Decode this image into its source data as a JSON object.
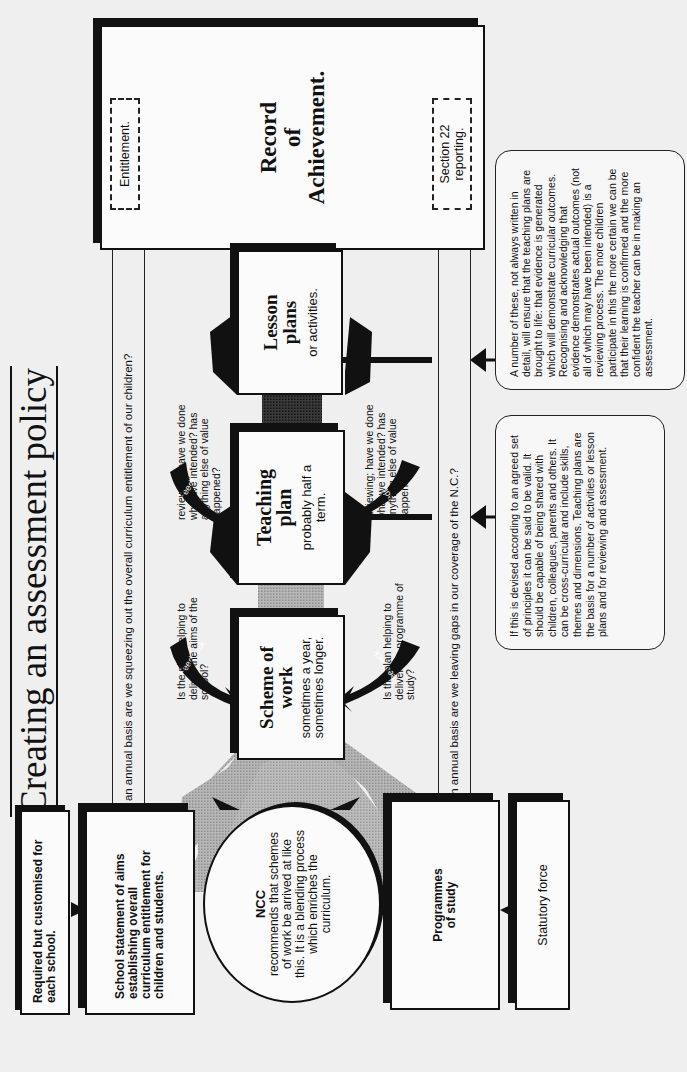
{
  "title": "Creating an assessment policy",
  "feedback_lines": {
    "top": "Feedback: on an annual basis are we squeezing out the overall curriculum entitlement of our children?",
    "bottom": "Feedback: on an annual basis are we leaving gaps in our coverage of the N.C.?"
  },
  "record_of_achievement": {
    "title_lines": [
      "Record",
      "of",
      "Achievement."
    ],
    "entitlement_label": "Entitlement.",
    "section22_label": "Section 22 reporting."
  },
  "lesson_plans": {
    "title": "Lesson plans",
    "subtitle": "or activities.",
    "question_top": "reviewing; have we done what we intended? has anything else of value happened?",
    "question_bottom": "reviewing; have we done what we intended? has anything else of value happened?"
  },
  "teaching_plan": {
    "title": "Teaching plan",
    "subtitle": "probably half a term.",
    "question_top": "Is the plan helping to deliver the aims of the school?",
    "question_bottom": "Is the plan helping to deliver the programme of study?"
  },
  "scheme_of_work": {
    "title": "Scheme of work",
    "subtitle": "sometimes a year, sometimes longer."
  },
  "feedback_arrow_label": "Feedback",
  "notes": {
    "lesson_note": "A number of these, not always written in detail, will ensure that the teaching plans are brought to life: that evidence is generated which will demonstrate curricular outcomes. Recognising and acknowledging that evidence demonstrates actual outcomes (not all of which may have been intended) is a reviewing process.  The more children participate in this the more certain we can be that their learning is confirmed and the more confident the teacher can be in making an assessment.",
    "teaching_note": "If this is devised according to an agreed set of principles it can be said to be valid.  It should be capable of being shared with children, colleagues, parents and others.  It can be cross-curricular and include skills, themes and dimensions.  Teaching plans are the basis for a number of activities or lesson plans and for reviewing and assessment."
  },
  "bottom_boxes": {
    "required": "Required but customised for each school.",
    "school_statement": "School statement of aims establishing overall curriculum entitlement for children and students.",
    "ncc": {
      "heading": "NCC",
      "body": "recommends that schemes of work be arrived at like this. It is a blending process which enriches the curriculum."
    },
    "programmes": "Programmes of study",
    "statutory": "Statutory force"
  },
  "colors": {
    "ink": "#111111",
    "paper": "#efefef",
    "grey_fill": "#a9a9a9",
    "dark_fill": "#2a2a2a"
  }
}
